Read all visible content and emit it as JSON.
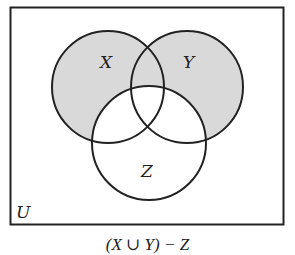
{
  "diagram": {
    "type": "venn",
    "universe_label": "U",
    "sets": [
      {
        "label": "X",
        "cx": 108,
        "cy": 87,
        "r": 56
      },
      {
        "label": "Y",
        "cx": 187,
        "cy": 87,
        "r": 56
      },
      {
        "label": "Z",
        "cx": 149,
        "cy": 143,
        "r": 57
      }
    ],
    "shaded_region": "(X ∪ Y) − Z",
    "shade_color": "#d9d9d9",
    "caption": "(X ∪ Y) − Z"
  }
}
